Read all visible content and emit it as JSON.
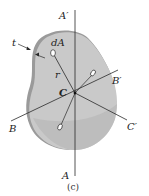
{
  "figure": {
    "caption": "(c)",
    "colors": {
      "plate_fill": "#c9c9c9",
      "plate_edge": "#9a9a9a",
      "line": "#2a2a2a",
      "background": "#ffffff"
    },
    "labels": {
      "a_prime": "A′",
      "a": "A",
      "b": "B",
      "b_prime": "B′",
      "c_prime": "C′",
      "c": "C",
      "da": "dA",
      "r": "r",
      "t": "t"
    }
  }
}
